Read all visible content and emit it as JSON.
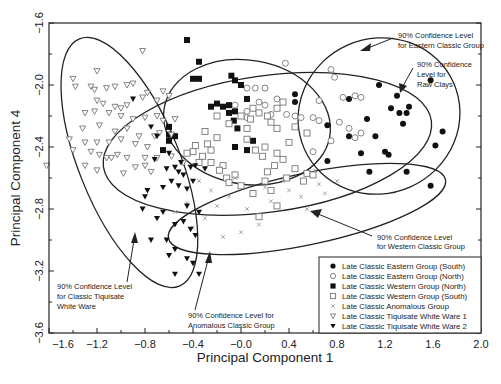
{
  "chart_data": {
    "type": "scatter",
    "title": "",
    "xlabel": "Principal Component 1",
    "ylabel": "Principal Component 4",
    "xlim": [
      -1.6,
      2.0
    ],
    "ylim": [
      -3.6,
      -1.6
    ],
    "xticks": [
      "-1.6",
      "-1.2",
      "-0.8",
      "-0.4",
      "-0.0",
      "0.4",
      "0.8",
      "1.2",
      "1.6",
      "2.0"
    ],
    "yticks": [
      "-1.6",
      "-2.0",
      "-2.4",
      "-2.8",
      "-3.2",
      "-3.6"
    ],
    "grid": false,
    "legend_position": "lower right",
    "series": [
      {
        "name": "Late Classic Eastern Group (South)",
        "marker": "filled-circle",
        "points": [
          [
            0.2,
            -2.02
          ],
          [
            0.45,
            -2.06
          ],
          [
            0.45,
            -2.11
          ],
          [
            0.9,
            -2.09
          ],
          [
            1.15,
            -2.0
          ],
          [
            1.3,
            -2.07
          ],
          [
            1.58,
            -1.97
          ],
          [
            1.4,
            -2.14
          ],
          [
            1.25,
            -2.15
          ],
          [
            1.32,
            -2.18
          ],
          [
            1.38,
            -2.18
          ],
          [
            1.35,
            -2.25
          ],
          [
            1.05,
            -2.22
          ],
          [
            0.72,
            -2.26
          ],
          [
            0.9,
            -2.33
          ],
          [
            1.12,
            -2.33
          ],
          [
            1.68,
            -2.3
          ],
          [
            1.62,
            -2.39
          ],
          [
            1.2,
            -2.43
          ],
          [
            1.23,
            -2.45
          ],
          [
            1.0,
            -2.44
          ],
          [
            1.07,
            -2.56
          ],
          [
            1.38,
            -2.56
          ],
          [
            0.72,
            -2.49
          ],
          [
            1.58,
            -2.65
          ]
        ]
      },
      {
        "name": "Late Classic Eastern Group (North)",
        "marker": "open-circle",
        "points": [
          [
            0.37,
            -1.86
          ],
          [
            0.75,
            -1.9
          ],
          [
            0.78,
            -1.95
          ],
          [
            0.05,
            -2.02
          ],
          [
            0.12,
            -2.02
          ],
          [
            0.2,
            -2.02
          ],
          [
            0.3,
            -2.09
          ],
          [
            0.65,
            -2.1
          ],
          [
            0.85,
            -2.08
          ],
          [
            0.95,
            -2.07
          ],
          [
            1.0,
            -2.08
          ],
          [
            0.15,
            -2.11
          ],
          [
            0.2,
            -2.13
          ],
          [
            -0.05,
            -2.13
          ],
          [
            0.05,
            -2.17
          ],
          [
            0.25,
            -2.19
          ],
          [
            0.45,
            -2.2
          ],
          [
            0.5,
            -2.21
          ],
          [
            0.38,
            -2.19
          ],
          [
            0.6,
            -2.21
          ],
          [
            0.65,
            -2.23
          ],
          [
            0.82,
            -2.24
          ],
          [
            0.9,
            -2.28
          ],
          [
            0.95,
            -2.34
          ],
          [
            0.75,
            -2.36
          ],
          [
            0.6,
            -2.43
          ],
          [
            1.0,
            -2.31
          ],
          [
            0.05,
            -2.21
          ]
        ]
      },
      {
        "name": "Late Classic Western Group (North)",
        "marker": "filled-square",
        "points": [
          [
            -0.45,
            -1.71
          ],
          [
            -0.35,
            -1.85
          ],
          [
            -0.4,
            -1.96
          ],
          [
            -0.35,
            -1.96
          ],
          [
            -0.08,
            -1.94
          ],
          [
            -0.05,
            -1.97
          ],
          [
            0.0,
            -2.0
          ],
          [
            0.05,
            -2.09
          ],
          [
            -0.25,
            -2.14
          ],
          [
            -0.2,
            -2.12
          ],
          [
            -0.15,
            -2.14
          ],
          [
            -0.1,
            -2.13
          ],
          [
            -0.05,
            -2.17
          ],
          [
            -0.1,
            -2.18
          ],
          [
            -0.06,
            -2.23
          ],
          [
            -0.03,
            -2.28
          ],
          [
            -0.6,
            -2.27
          ],
          [
            -0.6,
            -2.32
          ],
          [
            0.1,
            -2.36
          ],
          [
            0.05,
            -2.42
          ],
          [
            -0.6,
            -2.36
          ],
          [
            -0.65,
            -2.42
          ],
          [
            -0.55,
            -2.33
          ],
          [
            -0.05,
            -2.4
          ]
        ]
      },
      {
        "name": "Late Classic Western Group (South)",
        "marker": "open-square",
        "points": [
          [
            0.35,
            -2.11
          ],
          [
            0.3,
            -2.15
          ],
          [
            0.1,
            -2.15
          ],
          [
            0.15,
            -2.18
          ],
          [
            0.08,
            -2.22
          ],
          [
            0.0,
            -2.2
          ],
          [
            0.22,
            -2.2
          ],
          [
            0.25,
            -2.24
          ],
          [
            0.3,
            -2.28
          ],
          [
            0.45,
            -2.27
          ],
          [
            0.55,
            -2.31
          ],
          [
            -0.2,
            -2.2
          ],
          [
            -0.1,
            -2.25
          ],
          [
            0.05,
            -2.28
          ],
          [
            -0.3,
            -2.3
          ],
          [
            -0.2,
            -2.34
          ],
          [
            -0.28,
            -2.38
          ],
          [
            -0.38,
            -2.39
          ],
          [
            -0.4,
            -2.43
          ],
          [
            -0.32,
            -2.46
          ],
          [
            -0.25,
            -2.5
          ],
          [
            -0.15,
            -2.52
          ],
          [
            -0.18,
            -2.55
          ],
          [
            -0.12,
            -2.6
          ],
          [
            -0.1,
            -2.63
          ],
          [
            0.05,
            -2.35
          ],
          [
            0.12,
            -2.42
          ],
          [
            0.2,
            -2.4
          ],
          [
            0.18,
            -2.46
          ],
          [
            0.3,
            -2.44
          ],
          [
            0.4,
            -2.37
          ],
          [
            0.35,
            -2.48
          ],
          [
            0.28,
            -2.52
          ],
          [
            0.22,
            -2.56
          ],
          [
            0.2,
            -2.62
          ],
          [
            0.25,
            -2.68
          ],
          [
            -0.05,
            -2.58
          ],
          [
            0.0,
            -2.65
          ],
          [
            0.1,
            -2.7
          ],
          [
            0.3,
            -2.78
          ],
          [
            -0.25,
            -2.42
          ],
          [
            -0.35,
            -2.5
          ],
          [
            0.38,
            -2.6
          ],
          [
            0.45,
            -2.54
          ],
          [
            0.55,
            -2.57
          ],
          [
            -0.45,
            -2.44
          ],
          [
            0.52,
            -2.62
          ],
          [
            0.6,
            -2.58
          ],
          [
            0.15,
            -2.85
          ]
        ]
      },
      {
        "name": "Late Classic Anomalous Group",
        "marker": "x",
        "points": [
          [
            -0.35,
            -2.62
          ],
          [
            -0.25,
            -2.68
          ],
          [
            -0.2,
            -2.78
          ],
          [
            -0.3,
            -2.86
          ],
          [
            -0.1,
            -2.72
          ],
          [
            0.05,
            -2.8
          ],
          [
            0.15,
            -2.9
          ],
          [
            0.25,
            -2.75
          ],
          [
            -0.4,
            -2.92
          ],
          [
            -0.55,
            -2.82
          ],
          [
            -0.45,
            -2.76
          ],
          [
            0.4,
            -2.68
          ],
          [
            0.5,
            -2.72
          ],
          [
            0.55,
            -2.8
          ],
          [
            0.65,
            -2.64
          ],
          [
            0.7,
            -2.7
          ],
          [
            0.62,
            -2.55
          ],
          [
            0.0,
            -2.95
          ],
          [
            -0.15,
            -2.98
          ],
          [
            0.35,
            -2.62
          ],
          [
            -0.05,
            -2.6
          ],
          [
            0.2,
            -2.66
          ],
          [
            0.8,
            -2.62
          ]
        ]
      },
      {
        "name": "Late Classic Tiquisate White Ware 1",
        "marker": "open-triangle-down",
        "points": [
          [
            -0.82,
            -1.78
          ],
          [
            -1.2,
            -1.91
          ],
          [
            -1.4,
            -1.96
          ],
          [
            -1.38,
            -2.01
          ],
          [
            -1.25,
            -2.01
          ],
          [
            -1.22,
            -2.03
          ],
          [
            -1.12,
            -2.02
          ],
          [
            -1.05,
            -2.01
          ],
          [
            -0.95,
            -2.0
          ],
          [
            -0.9,
            -1.99
          ],
          [
            -0.78,
            -2.05
          ],
          [
            -0.65,
            -2.04
          ],
          [
            -0.6,
            -2.07
          ],
          [
            -0.7,
            -2.1
          ],
          [
            -0.82,
            -2.08
          ],
          [
            -1.15,
            -2.12
          ],
          [
            -1.2,
            -2.1
          ],
          [
            -1.05,
            -2.14
          ],
          [
            -1.0,
            -2.15
          ],
          [
            -0.95,
            -2.13
          ],
          [
            -1.3,
            -2.18
          ],
          [
            -1.22,
            -2.17
          ],
          [
            -1.1,
            -2.18
          ],
          [
            -1.0,
            -2.2
          ],
          [
            -0.9,
            -2.22
          ],
          [
            -0.8,
            -2.21
          ],
          [
            -0.7,
            -2.2
          ],
          [
            -0.65,
            -2.23
          ],
          [
            -0.55,
            -2.22
          ],
          [
            -1.32,
            -2.28
          ],
          [
            -1.18,
            -2.26
          ],
          [
            -1.05,
            -2.3
          ],
          [
            -0.95,
            -2.28
          ],
          [
            -0.85,
            -2.33
          ],
          [
            -0.72,
            -2.33
          ],
          [
            -0.68,
            -2.31
          ],
          [
            -0.58,
            -2.32
          ],
          [
            -1.43,
            -2.35
          ],
          [
            -1.3,
            -2.37
          ],
          [
            -1.2,
            -2.37
          ],
          [
            -1.1,
            -2.37
          ],
          [
            -1.0,
            -2.35
          ],
          [
            -0.88,
            -2.38
          ],
          [
            -0.78,
            -2.4
          ],
          [
            -1.4,
            -2.42
          ],
          [
            -1.25,
            -2.43
          ],
          [
            -1.18,
            -2.45
          ],
          [
            -1.12,
            -2.47
          ],
          [
            -1.08,
            -2.47
          ],
          [
            -1.03,
            -2.45
          ],
          [
            -0.95,
            -2.47
          ],
          [
            -0.8,
            -2.47
          ],
          [
            -0.7,
            -2.47
          ],
          [
            -0.58,
            -2.46
          ],
          [
            -1.62,
            -2.52
          ],
          [
            -1.3,
            -2.52
          ],
          [
            -1.2,
            -2.55
          ],
          [
            -0.98,
            -2.57
          ],
          [
            -0.88,
            -2.53
          ],
          [
            -0.8,
            -2.52
          ],
          [
            -0.75,
            -2.56
          ],
          [
            -0.48,
            -2.5
          ]
        ]
      },
      {
        "name": "Late Classic Tiquisate White Ware 2",
        "marker": "filled-triangle-down",
        "points": [
          [
            -0.9,
            -2.09
          ],
          [
            -0.75,
            -2.27
          ],
          [
            -0.7,
            -2.33
          ],
          [
            -0.6,
            -2.44
          ],
          [
            -0.55,
            -2.53
          ],
          [
            -0.5,
            -2.5
          ],
          [
            -0.52,
            -2.56
          ],
          [
            -0.48,
            -2.58
          ],
          [
            -0.42,
            -2.53
          ],
          [
            -0.38,
            -2.52
          ],
          [
            -0.3,
            -2.54
          ],
          [
            -0.72,
            -2.48
          ],
          [
            -0.62,
            -2.54
          ],
          [
            -0.58,
            -2.62
          ],
          [
            -0.65,
            -2.66
          ],
          [
            -0.52,
            -2.65
          ],
          [
            -0.45,
            -2.67
          ],
          [
            -0.4,
            -2.62
          ],
          [
            -0.45,
            -2.78
          ],
          [
            -0.35,
            -2.82
          ],
          [
            -0.65,
            -2.82
          ],
          [
            -0.7,
            -2.86
          ],
          [
            -0.55,
            -2.9
          ],
          [
            -0.48,
            -2.88
          ],
          [
            -0.42,
            -2.93
          ],
          [
            -0.38,
            -2.97
          ],
          [
            -0.55,
            -3.06
          ],
          [
            -0.45,
            -3.12
          ],
          [
            -0.4,
            -3.15
          ],
          [
            -0.35,
            -3.22
          ],
          [
            -0.55,
            -3.22
          ],
          [
            -0.6,
            -3.1
          ],
          [
            -0.62,
            -3.0
          ],
          [
            -0.75,
            -3.0
          ],
          [
            -0.8,
            -2.72
          ],
          [
            -0.82,
            -2.8
          ],
          [
            -0.78,
            -2.68
          ]
        ]
      }
    ],
    "ellipses": [
      {
        "label": "Classic Tiquisate White Ware",
        "cx": -0.93,
        "cy": -2.5,
        "rx": 0.42,
        "ry": 0.86,
        "rot": -22
      },
      {
        "label": "Western Classic Group",
        "cx": 0.05,
        "cy": -2.24,
        "rx": 0.7,
        "ry": 0.4,
        "rot": 10
      },
      {
        "label": "Eastern Classic Group",
        "cx": 1.15,
        "cy": -2.2,
        "rx": 0.68,
        "ry": 0.5,
        "rot": -24
      },
      {
        "label": "Raw Clays",
        "cx": 0.22,
        "cy": -2.38,
        "rx": 1.38,
        "ry": 0.44,
        "rot": -8
      },
      {
        "label": "Anomalous Classic Group",
        "cx": 0.55,
        "cy": -2.8,
        "rx": 1.18,
        "ry": 0.23,
        "rot": -12
      }
    ],
    "annotations": [
      {
        "lines": [
          "90% Confidence Level",
          "for Eastern Classic Group"
        ]
      },
      {
        "lines": [
          "90% Confidence",
          "Level for",
          "Raw Clays"
        ]
      },
      {
        "lines": [
          "90% Confidence Level",
          "for Western Classic Group"
        ]
      },
      {
        "lines": [
          "90% Confidence Level",
          "for Classic Tiquisate",
          "White Ware"
        ]
      },
      {
        "lines": [
          "90% Confidence Level for",
          "Anomalous Classic Group"
        ]
      }
    ]
  },
  "colors": {
    "axis": "#222222",
    "marker": "#1a1a1a",
    "open_marker": "#777777",
    "background": "#ffffff"
  }
}
